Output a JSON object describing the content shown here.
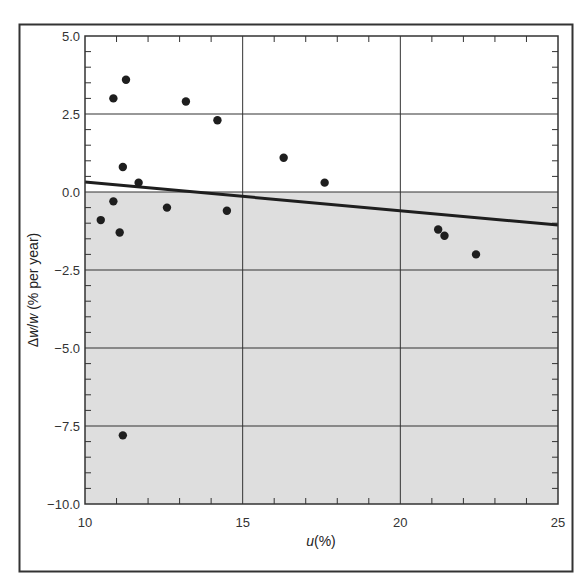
{
  "chart_data": {
    "type": "scatter",
    "title": "",
    "xlabel": "u(%)",
    "xlabel_parts": {
      "var": "u",
      "rest": "(%)"
    },
    "ylabel": "Δw/w (% per year)",
    "ylabel_parts": {
      "pre": "Δ",
      "var1": "w",
      "slash": "/",
      "var2": "w",
      "rest": " (% per year)"
    },
    "xlim": [
      10,
      25
    ],
    "ylim": [
      -10.0,
      5.0
    ],
    "x_ticks": [
      10,
      15,
      20,
      25
    ],
    "x_tick_labels": [
      "10",
      "15",
      "20",
      "25"
    ],
    "y_ticks": [
      5.0,
      2.5,
      0.0,
      -2.5,
      -5.0,
      -7.5,
      -10.0
    ],
    "y_tick_labels": [
      "5.0",
      "2.5",
      "0.0",
      "−2.5",
      "−5.0",
      "−7.5",
      "−10.0"
    ],
    "x_minor_step": 1,
    "y_minor_step": 0.5,
    "grid": true,
    "legend": null,
    "shaded_region": {
      "y_from": -10.0,
      "y_to": 0.0,
      "color": "#dedede"
    },
    "series": [
      {
        "name": "observations",
        "type": "scatter",
        "color": "#1e1e1e",
        "points": [
          {
            "x": 10.9,
            "y": 3.0
          },
          {
            "x": 11.3,
            "y": 3.6
          },
          {
            "x": 13.2,
            "y": 2.9
          },
          {
            "x": 14.2,
            "y": 2.3
          },
          {
            "x": 11.2,
            "y": 0.8
          },
          {
            "x": 11.7,
            "y": 0.3
          },
          {
            "x": 16.3,
            "y": 1.1
          },
          {
            "x": 17.6,
            "y": 0.3
          },
          {
            "x": 10.9,
            "y": -0.3
          },
          {
            "x": 10.5,
            "y": -0.9
          },
          {
            "x": 11.1,
            "y": -1.3
          },
          {
            "x": 12.6,
            "y": -0.5
          },
          {
            "x": 14.5,
            "y": -0.6
          },
          {
            "x": 21.2,
            "y": -1.2
          },
          {
            "x": 21.4,
            "y": -1.4
          },
          {
            "x": 22.4,
            "y": -2.0
          },
          {
            "x": 11.2,
            "y": -7.8
          }
        ]
      },
      {
        "name": "trend line",
        "type": "line",
        "color": "#1e1e1e",
        "points": [
          {
            "x": 10,
            "y": 0.32
          },
          {
            "x": 25,
            "y": -1.06
          }
        ]
      }
    ]
  },
  "colors": {
    "background": "#ffffff",
    "frame": "#333333",
    "grid": "#333333",
    "shade": "#dedede",
    "points": "#1e1e1e"
  }
}
